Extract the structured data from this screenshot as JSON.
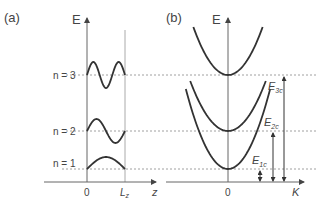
{
  "panel_a": {
    "label": "(a)",
    "y_axis_label": "E",
    "x_axis_label": "z",
    "x_ticks": [
      "0",
      "L"
    ],
    "x_tick_sub": "z",
    "levels": [
      {
        "label": "n = 3",
        "n": 3
      },
      {
        "label": "n = 2",
        "n": 2
      },
      {
        "label": "n = 1",
        "n": 1
      }
    ]
  },
  "panel_b": {
    "label": "(b)",
    "y_axis_label": "E",
    "x_axis_label": "K",
    "x_tick": "0",
    "energy_labels": [
      {
        "main": "E",
        "sub": "3c"
      },
      {
        "main": "E",
        "sub": "2c"
      },
      {
        "main": "E",
        "sub": "1c"
      }
    ]
  }
}
